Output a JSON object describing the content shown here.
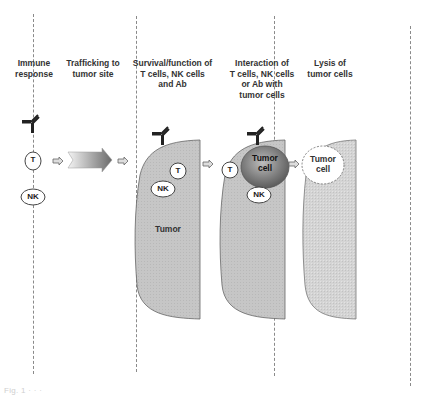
{
  "figure": {
    "columns": [
      {
        "header": "Immune\nresponse",
        "header_lines": [
          "Immune",
          "response"
        ]
      },
      {
        "header_lines": [
          "Trafficking to",
          "tumor site"
        ]
      },
      {
        "header_lines": [
          "Survival/function of",
          "T cells, NK cells",
          "and Ab"
        ]
      },
      {
        "header_lines": [
          "Interaction of",
          "T cells, NK cells",
          "or Ab with",
          "tumor cells"
        ]
      },
      {
        "header_lines": [
          "Lysis of",
          "tumor cells"
        ]
      }
    ],
    "cells": {
      "t_cell": "T",
      "nk_cell": "NK",
      "tumor_label": "Tumor",
      "tumor_cell_line1": "Tumor",
      "tumor_cell_line2": "cell"
    },
    "icons": [
      "antibody-icon",
      "small-arrow-icon",
      "gradient-arrow-icon"
    ],
    "colors": {
      "tumor_fill": "#c4c4c4",
      "tumor_fill_light": "#d2d2d2",
      "tumor_cell_dark": "#6e6e6e",
      "outline": "#555555",
      "dashed_line": "#8a8a8a"
    },
    "caption": "Fig. 1  ·  ·  ·"
  }
}
